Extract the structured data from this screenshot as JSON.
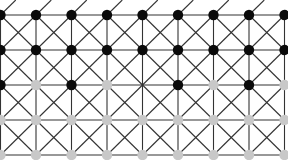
{
  "caption": "",
  "board": {
    "cols": 9,
    "rows": 5,
    "x0": 0.5,
    "dx": 35.5,
    "y0": 15,
    "dy": 35,
    "line_color": "#333333",
    "line_width": 1.1,
    "node_radius": 5.2,
    "colors": {
      "black": "#0a0a0a",
      "gray": "#c8c8c8"
    },
    "pieces": [
      [
        "black",
        "black",
        "black",
        "black",
        "black",
        "black",
        "black",
        "black",
        "black"
      ],
      [
        "black",
        "black",
        "black",
        "black",
        "black",
        "black",
        "black",
        "black",
        "black"
      ],
      [
        "black",
        "gray",
        "black",
        "gray",
        "empty",
        "black",
        "gray",
        "black",
        "gray"
      ],
      [
        "gray",
        "gray",
        "gray",
        "gray",
        "gray",
        "gray",
        "gray",
        "gray",
        "gray"
      ],
      [
        "gray",
        "gray",
        "gray",
        "gray",
        "gray",
        "gray",
        "gray",
        "gray",
        "gray"
      ]
    ]
  }
}
